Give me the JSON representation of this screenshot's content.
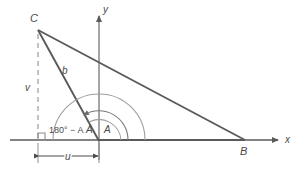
{
  "diagram": {
    "type": "geometry-triangle-coordinate-plane",
    "axes": {
      "x_label": "x",
      "y_label": "y",
      "origin_label": "A"
    },
    "vertices": [
      {
        "name": "C",
        "label": "C",
        "x": 38,
        "y": 30
      },
      {
        "name": "A",
        "label": "A",
        "x": 99,
        "y": 140
      },
      {
        "name": "B",
        "label": "B",
        "x": 245,
        "y": 140
      }
    ],
    "segments": [
      {
        "name": "side-b",
        "label": "b",
        "from": "C",
        "to": "A"
      },
      {
        "name": "side-CB",
        "label": "",
        "from": "C",
        "to": "B"
      },
      {
        "name": "side-AB",
        "label": "",
        "from": "A",
        "to": "B"
      }
    ],
    "dimensions": [
      {
        "name": "height-v",
        "label": "v",
        "kind": "dashed-vertical"
      },
      {
        "name": "horizontal-u",
        "label": "u",
        "kind": "double-arrow"
      }
    ],
    "angles": [
      {
        "name": "exterior-angle",
        "label": "180° − A",
        "vertex": "A",
        "kind": "large-arc"
      },
      {
        "name": "interior-angle-A",
        "label": "A",
        "vertex": "A",
        "kind": "small-arc"
      }
    ],
    "markers": [
      {
        "name": "right-angle-square",
        "label": "",
        "kind": "square"
      }
    ],
    "colors": {
      "line": "#5a5a5a",
      "arc": "#8c8c8c",
      "dashed": "#9a9a9a",
      "text": "#4a4a4a",
      "background": "#ffffff"
    }
  }
}
